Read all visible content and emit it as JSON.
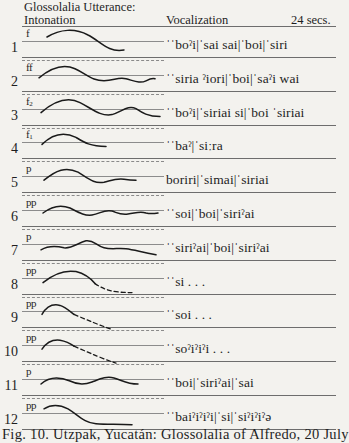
{
  "header": {
    "title_line1": "Glossolalia Utterance:",
    "title_line2": "Intonation",
    "vocalization_label": "Vocalization",
    "duration": "24 secs."
  },
  "rows": [
    {
      "number": "1",
      "dynamic": "f",
      "dynamic_sub": "",
      "vocalization": "ˈˈboˀi|ˈsai sai|ˈboi|ˈsiri",
      "contour": "M 47 -4 C 60 -12, 75 -13, 88 -6 C 100 0, 108 12, 124 9",
      "tail": ""
    },
    {
      "number": "2",
      "dynamic": "ff",
      "dynamic_sub": "",
      "vocalization": "ˈˈsiria ˀiori|ˈboi|ˈsaˀi wai",
      "contour": "M 39 3 C 50 -6, 62 -12, 75 -6 C 88 0, 92 6, 104 6 C 114 6, 118 2, 126 4 C 134 6, 140 9, 146 6 C 150 4, 152 3, 155 4",
      "tail": ""
    },
    {
      "number": "3",
      "dynamic": "f",
      "dynamic_sub": "2",
      "vocalization": "ˈˈboˀi|ˈsiriai si|ˈboi ˈsiriai",
      "contour": "M 41 4 C 55 -8, 68 -12, 80 -6 C 92 0, 100 8, 112 6 C 122 3, 128 -4, 136 0 C 142 4, 148 8, 160 8",
      "tail": ""
    },
    {
      "number": "4",
      "dynamic": "f",
      "dynamic_sub": "1",
      "vocalization": "ˈˈbaˀ|ˈsiːra",
      "contour": "M 42 2 C 52 -8, 64 -11, 76 -5 C 84 0, 90 4, 106 4",
      "tail": ""
    },
    {
      "number": "5",
      "dynamic": "p",
      "dynamic_sub": "",
      "vocalization": "boriri|ˈsimai|ˈsiriai",
      "contour": "M 44 4 C 56 -6, 66 -10, 78 -4 C 88 2, 94 8, 104 6 C 112 4, 116 2, 124 3 C 130 4, 132 4, 136 4",
      "tail": ""
    },
    {
      "number": "6",
      "dynamic": "pp",
      "dynamic_sub": "",
      "vocalization": "ˈˈsoi|ˈboi|ˈsiriˀai",
      "contour": "M 43 3 C 52 -4, 60 -6, 70 -2 C 78 2, 84 6, 92 5 C 100 4, 104 -1, 112 1 C 118 3, 120 5, 128 4 C 136 3, 140 1, 146 3 C 150 4, 152 4, 158 3",
      "tail": ""
    },
    {
      "number": "7",
      "dynamic": "p",
      "dynamic_sub": "",
      "vocalization": "ˈˈsiriˀai|ˈboi|ˈsiriˀai",
      "contour": "M 41 6 C 48 2, 56 2, 64 4 C 72 5, 78 -1, 86 -3 C 94 -4, 96 2, 104 4 C 112 6, 118 4, 126 5 C 134 6, 140 8, 156 11",
      "tail": ""
    },
    {
      "number": "8",
      "dynamic": "pp",
      "dynamic_sub": "",
      "vocalization": "ˈˈsi . . .",
      "contour": "M 43 5 C 54 -4, 64 -8, 76 -6 C 84 -4, 90 0, 95 6",
      "tail": "M 95 6 C 104 12, 112 15, 132 15"
    },
    {
      "number": "9",
      "dynamic": "pp",
      "dynamic_sub": "",
      "vocalization": "ˈˈsoi . . .",
      "contour": "M 42 3 C 46 -4, 52 -8, 60 -6 C 66 -4, 70 0, 74 3",
      "tail": "M 74 3 C 88 9, 100 14, 112 18"
    },
    {
      "number": "10",
      "dynamic": "pp",
      "dynamic_sub": "",
      "vocalization": "ˈˈsoˀiˀiˀi . . .",
      "contour": "M 42 4 C 46 -2, 52 -6, 60 -5 C 66 -4, 70 -2, 74 1",
      "tail": "M 74 1 C 90 8, 104 14, 116 18"
    },
    {
      "number": "11",
      "dynamic": "p",
      "dynamic_sub": "",
      "vocalization": "ˈˈboi|ˈsiriˀai|ˈsai",
      "contour": "M 41 5 C 50 -3, 60 -2, 70 2 C 78 6, 84 6, 92 3 C 100 0, 106 -3, 114 -1 C 122 1, 126 5, 138 5",
      "tail": ""
    },
    {
      "number": "12",
      "dynamic": "pp",
      "dynamic_sub": "",
      "vocalization": "ˈˈbaiˀiˀiˀi|ˈsi|ˈsiˀiˀiˀə",
      "contour": "M 44 -4 C 52 -9, 60 -8, 68 -4 C 78 2, 84 10, 96 11 C 108 12, 118 11, 132 12",
      "tail": ""
    }
  ],
  "caption": "Fig. 10.  Utzpak, Yucatán: Glossolalia of Alfredo, 20 July"
}
